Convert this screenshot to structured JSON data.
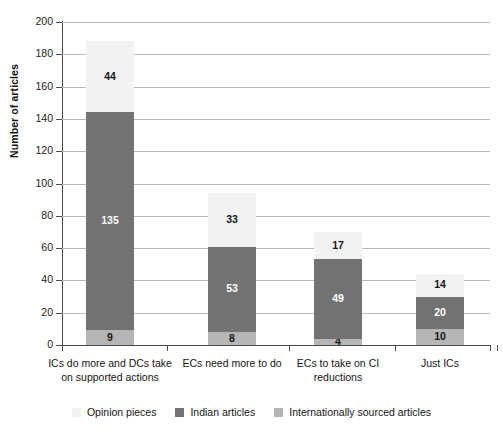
{
  "chart_data": {
    "type": "bar",
    "subtype": "stacked-vertical",
    "title": "",
    "xlabel": "",
    "ylabel": "Number of articles",
    "ylim": [
      0,
      200
    ],
    "ytick_step": 20,
    "yticks": [
      200,
      180,
      160,
      140,
      120,
      100,
      80,
      60,
      40,
      20,
      0
    ],
    "grid": "horizontal",
    "legend_position": "bottom",
    "categories": [
      "ICs do more and DCs take on supported actions",
      "ECs need more to do",
      "ECs to take on CI reductions",
      "Just ICs"
    ],
    "series": [
      {
        "name": "Internationally sourced articles",
        "color": "#b5b5b5",
        "values": [
          9,
          8,
          4,
          10
        ]
      },
      {
        "name": "Indian articles",
        "color": "#727272",
        "values": [
          135,
          53,
          49,
          20
        ]
      },
      {
        "name": "Opinion pieces",
        "color": "#f2f2f2",
        "values": [
          44,
          33,
          17,
          14
        ]
      }
    ],
    "totals": [
      188,
      94,
      70,
      44
    ],
    "stack_order_bottom_to_top": [
      "Internationally sourced articles",
      "Indian articles",
      "Opinion pieces"
    ]
  },
  "axis": {
    "y_title": "Number of articles",
    "y_tick_labels": [
      "200",
      "180",
      "160",
      "140",
      "120",
      "100",
      "80",
      "60",
      "40",
      "20",
      "0"
    ],
    "x_tick_labels": [
      "ICs do more and DCs take on supported actions",
      "ECs need more to do",
      "ECs to take on CI reductions",
      "Just ICs"
    ]
  },
  "legend": {
    "items": [
      {
        "label": "Opinion pieces",
        "color": "#f2f2f2"
      },
      {
        "label": "Indian articles",
        "color": "#727272"
      },
      {
        "label": "Internationally sourced articles",
        "color": "#b5b5b5"
      }
    ]
  },
  "labels": {
    "bar1": {
      "bottom": "9",
      "middle": "135",
      "top": "44"
    },
    "bar2": {
      "bottom": "8",
      "middle": "53",
      "top": "33"
    },
    "bar3": {
      "bottom": "4",
      "middle": "49",
      "top": "17"
    },
    "bar4": {
      "bottom": "10",
      "middle": "20",
      "top": "14"
    }
  },
  "colors": {
    "dark_gray": "#727272",
    "mid_gray": "#b5b5b5",
    "near_white": "#f2f2f2",
    "gridline": "#b9b9b9",
    "axis": "#4a4a4a",
    "text": "#151515",
    "label_on_dark": "#ffffff"
  }
}
